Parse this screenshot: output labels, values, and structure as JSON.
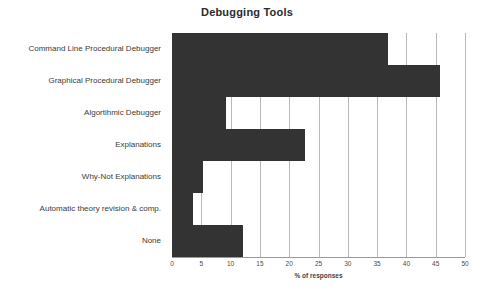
{
  "chart_data": {
    "type": "bar",
    "orientation": "horizontal",
    "title": "Debugging Tools",
    "xlabel": "% of responses",
    "ylabel": "",
    "xlim": [
      0,
      50
    ],
    "xticks": [
      0,
      5,
      10,
      15,
      20,
      25,
      30,
      35,
      40,
      45,
      50
    ],
    "grid": "vertical",
    "legend": null,
    "bar_color": "#333333",
    "categories": [
      "Command Line Procedural Debugger",
      "Graphical Procedural Debugger",
      "Algortihmic Debugger",
      "Explanations",
      "Why-Not Explanations",
      "Automatic theory revision & comp.",
      "None"
    ],
    "values": [
      36.9,
      45.8,
      9.2,
      22.7,
      5.3,
      3.5,
      12.1
    ]
  }
}
